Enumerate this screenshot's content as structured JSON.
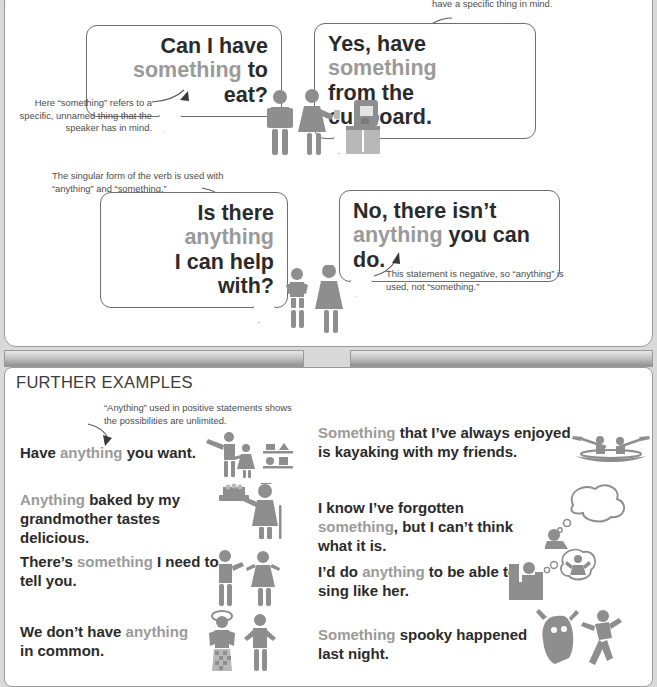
{
  "page": {
    "background_color": "#d9d9d9",
    "panel_color": "#ffffff",
    "accent_gray": "#9a9a9a",
    "text_color": "#2b2b2b"
  },
  "top_panel": {
    "scene_food": {
      "question_bubble": {
        "name": "can-i-have-something-to-eat",
        "parts": [
          {
            "text": "Can I have",
            "style": "dark"
          },
          {
            "text": " ",
            "style": "dark"
          },
          {
            "text": "something",
            "style": "gray"
          },
          {
            "text": " to eat?",
            "style": "dark"
          }
        ],
        "line1_dark": "Can I have",
        "line2_gray": "something",
        "line2_dark": " to eat?"
      },
      "answer_bubble": {
        "name": "yes-have-something-from-the-cupboard",
        "line1_dark": "Yes, have ",
        "line1_gray": "something",
        "line2_dark": "from the cupboard."
      },
      "illustration": "kitchen-couple-with-coffee-machine"
    },
    "scene_help": {
      "question_bubble": {
        "name": "is-there-anything-i-can-help-with",
        "line1_dark": "Is there ",
        "line1_gray": "anything",
        "line2_dark": "I can help with?"
      },
      "answer_bubble": {
        "name": "no-there-isnt-anything-you-can-do",
        "line1_dark": "No, there isn’t",
        "line2_gray": "anything",
        "line2_dark": " you can do."
      },
      "illustration": "child-and-adult-standing"
    },
    "annotations": [
      {
        "name": "note-specific-thing",
        "text": "Here “something” refers to a specific, unnamed thing that the speaker has in mind."
      },
      {
        "name": "note-nonspecific-thing",
        "text": "have a specific thing in mind."
      },
      {
        "name": "note-singular-verb",
        "text": "The singular form of the verb is used with “anything” and “something.”"
      },
      {
        "name": "note-negative-statement",
        "text": "This statement is negative, so “anything” is used, not “something.”"
      }
    ]
  },
  "bottom_panel": {
    "title": "FURTHER EXAMPLES",
    "annotation": {
      "name": "note-positive-unlimited",
      "text": "“Anything” used in positive statements shows the possibilities are unlimited."
    },
    "examples_left": [
      {
        "name": "example-have-anything-you-want",
        "pre": "Have ",
        "gray": "anything",
        "post": " you want.",
        "illustration": "man-child-shop-shelves"
      },
      {
        "name": "example-anything-baked-by-grandmother",
        "pre": "",
        "gray": "Anything",
        "post": " baked by my grandmother tastes delicious.",
        "illustration": "grandmother-with-cake-tray"
      },
      {
        "name": "example-theres-something-i-need-to-tell-you",
        "pre": "There’s ",
        "gray": "something",
        "post": " I need to tell you.",
        "illustration": "two-people-talking"
      },
      {
        "name": "example-we-dont-have-anything-in-common",
        "pre": "We don’t have ",
        "gray": "anything",
        "post": " in common.",
        "illustration": "clown-and-plain-person"
      }
    ],
    "examples_right": [
      {
        "name": "example-something-ive-always-enjoyed-kayaking",
        "pre": "",
        "gray": "Something",
        "post": " that I’ve always enjoyed is kayaking with my friends.",
        "illustration": "kayak-with-two-paddlers"
      },
      {
        "name": "example-i-know-ive-forgotten-something",
        "pre": "I know I’ve forgotten ",
        "gray": "something",
        "post": ", but I can’t think what it is.",
        "illustration": "person-with-thought-cloud"
      },
      {
        "name": "example-id-do-anything-to-sing-like-her",
        "pre": "I’d do ",
        "gray": "anything",
        "post": " to be able to sing like her.",
        "illustration": "person-in-armchair-dreaming-of-singer"
      },
      {
        "name": "example-something-spooky-happened-last-night",
        "pre": "",
        "gray": "Something",
        "post": " spooky happened last night.",
        "illustration": "ghost-chasing-running-person"
      }
    ]
  }
}
